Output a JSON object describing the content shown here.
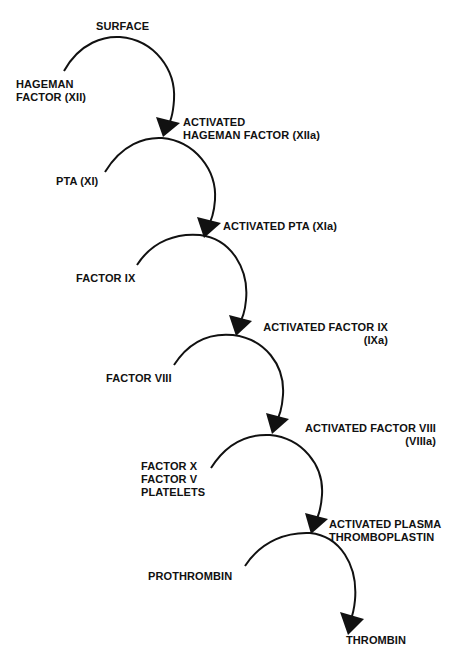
{
  "diagram": {
    "colors": {
      "line": "#111111",
      "background": "#ffffff"
    },
    "steps": [
      {
        "substrate": [
          "HAGEMAN",
          "FACTOR (XII)"
        ],
        "cofactor": "SURFACE",
        "product": [
          "ACTIVATED",
          "HAGEMAN FACTOR (XIIa)"
        ]
      },
      {
        "substrate": [
          "PTA (XI)"
        ],
        "product": [
          "ACTIVATED PTA (XIa)"
        ]
      },
      {
        "substrate": [
          "FACTOR IX"
        ],
        "product": [
          "ACTIVATED FACTOR IX",
          "(IXa)"
        ]
      },
      {
        "substrate": [
          "FACTOR VIII"
        ],
        "product": [
          "ACTIVATED FACTOR VIII",
          "(VIIIa)"
        ]
      },
      {
        "substrate": [
          "FACTOR X",
          "FACTOR V",
          "PLATELETS"
        ],
        "product": [
          "ACTIVATED PLASMA",
          "THROMBOPLASTIN"
        ]
      },
      {
        "substrate": [
          "PROTHROMBIN"
        ],
        "product": [
          "THROMBIN"
        ]
      }
    ]
  }
}
